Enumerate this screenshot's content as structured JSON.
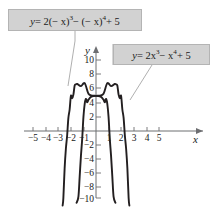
{
  "figure": {
    "name": "polynomial-reflection-graph",
    "background_color": "#ffffff",
    "curve_color": "#231f20",
    "axis_color": "#6d6e71",
    "callout_fill": "#d2d2d2",
    "callout_border": "#b4b4b4",
    "leader_color": "#9a9a9a"
  },
  "callouts": {
    "left": {
      "y": "y",
      "eq": "= 2(− x)",
      "exp1": "3",
      "op2": "− (− x)",
      "exp2": "4",
      "tail": "+ 5",
      "full_text": "y = 2(− x)³ − (− x)⁴ + 5"
    },
    "right": {
      "y": "y",
      "eq": "= 2x",
      "exp1": "3",
      "op2": "− x",
      "exp2": "4",
      "tail": "+ 5",
      "full_text": "y = 2x³ − x⁴ + 5"
    }
  },
  "axes": {
    "x_label": "x",
    "y_label": "y",
    "x_ticks": [
      {
        "value": -5,
        "label": "−5"
      },
      {
        "value": -4,
        "label": "−4"
      },
      {
        "value": -3,
        "label": "−3"
      },
      {
        "value": -2,
        "label": "−2"
      },
      {
        "value": -1,
        "label": "−1"
      },
      {
        "value": 1,
        "label": "1"
      },
      {
        "value": 2,
        "label": "2"
      },
      {
        "value": 3,
        "label": "3"
      },
      {
        "value": 4,
        "label": "4"
      },
      {
        "value": 5,
        "label": "5"
      }
    ],
    "y_ticks": [
      {
        "value": 10,
        "label": "10"
      },
      {
        "value": 8,
        "label": "8"
      },
      {
        "value": 6,
        "label": "6"
      },
      {
        "value": 4,
        "label": "4"
      },
      {
        "value": 2,
        "label": "2"
      },
      {
        "value": -2,
        "label": "−2"
      },
      {
        "value": -4,
        "label": "−4"
      },
      {
        "value": -6,
        "label": "−6"
      },
      {
        "value": -8,
        "label": "−8"
      },
      {
        "value": -10,
        "label": "−10"
      }
    ]
  },
  "chart_data": {
    "type": "line",
    "title": "",
    "xlabel": "x",
    "ylabel": "y",
    "xlim": [
      -5.6,
      5.6
    ],
    "ylim": [
      -10.6,
      11.2
    ],
    "grid": false,
    "legend": "callout-labels",
    "series": [
      {
        "name": "y = 2x³ − x⁴ + 5",
        "equation": "y = 2*x^3 - x^4 + 5",
        "color": "#231f20",
        "points": [
          {
            "x": -1.55,
            "y": -10.21
          },
          {
            "x": -1.4,
            "y": -9.33
          },
          {
            "x": -1.3,
            "y": -6.45
          },
          {
            "x": -1.2,
            "y": -3.53
          },
          {
            "x": -1.1,
            "y": -1.12
          },
          {
            "x": -1.0,
            "y": 2.0
          },
          {
            "x": -0.9,
            "y": 3.87
          },
          {
            "x": -0.8,
            "y": 4.56
          },
          {
            "x": -0.7,
            "y": 4.07
          },
          {
            "x": -0.6,
            "y": 4.44
          },
          {
            "x": -0.5,
            "y": 4.69
          },
          {
            "x": -0.4,
            "y": 4.85
          },
          {
            "x": -0.2,
            "y": 4.98
          },
          {
            "x": 0.0,
            "y": 5.0
          },
          {
            "x": 0.3,
            "y": 5.04
          },
          {
            "x": 0.6,
            "y": 5.3
          },
          {
            "x": 0.9,
            "y": 6.8
          },
          {
            "x": 1.2,
            "y": 6.38
          },
          {
            "x": 1.5,
            "y": 6.69
          },
          {
            "x": 1.6,
            "y": 6.64
          },
          {
            "x": 1.7,
            "y": 6.47
          },
          {
            "x": 1.8,
            "y": 5.17
          },
          {
            "x": 1.9,
            "y": 4.67
          },
          {
            "x": 2.0,
            "y": 5.0
          },
          {
            "x": 2.1,
            "y": 3.06
          },
          {
            "x": 2.2,
            "y": 1.86
          },
          {
            "x": 2.3,
            "y": -0.64
          },
          {
            "x": 2.4,
            "y": -2.52
          },
          {
            "x": 2.5,
            "y": -5.31
          },
          {
            "x": 2.6,
            "y": -9.54
          },
          {
            "x": 2.66,
            "y": -10.6
          }
        ]
      },
      {
        "name": "y = 2(−x)³ − (−x)⁴ + 5",
        "equation": "y = 2*(-x)^3 - (-x)^4 + 5",
        "color": "#231f20",
        "points": [
          {
            "x": 1.55,
            "y": -10.21
          },
          {
            "x": 1.4,
            "y": -9.33
          },
          {
            "x": 1.3,
            "y": -6.45
          },
          {
            "x": 1.2,
            "y": -3.53
          },
          {
            "x": 1.1,
            "y": -1.12
          },
          {
            "x": 1.0,
            "y": 2.0
          },
          {
            "x": 0.9,
            "y": 3.87
          },
          {
            "x": 0.8,
            "y": 4.56
          },
          {
            "x": 0.7,
            "y": 4.07
          },
          {
            "x": 0.6,
            "y": 4.44
          },
          {
            "x": 0.5,
            "y": 4.69
          },
          {
            "x": 0.4,
            "y": 4.85
          },
          {
            "x": 0.2,
            "y": 4.98
          },
          {
            "x": 0.0,
            "y": 5.0
          },
          {
            "x": -0.3,
            "y": 5.04
          },
          {
            "x": -0.6,
            "y": 5.3
          },
          {
            "x": -0.9,
            "y": 6.8
          },
          {
            "x": -1.2,
            "y": 6.38
          },
          {
            "x": -1.5,
            "y": 6.69
          },
          {
            "x": -1.6,
            "y": 6.64
          },
          {
            "x": -1.7,
            "y": 6.47
          },
          {
            "x": -1.8,
            "y": 5.17
          },
          {
            "x": -1.9,
            "y": 4.67
          },
          {
            "x": -2.0,
            "y": 5.0
          },
          {
            "x": -2.1,
            "y": 3.06
          },
          {
            "x": -2.2,
            "y": 1.86
          },
          {
            "x": -2.3,
            "y": -0.64
          },
          {
            "x": -2.4,
            "y": -2.52
          },
          {
            "x": -2.5,
            "y": -5.31
          },
          {
            "x": -2.6,
            "y": -9.54
          },
          {
            "x": -2.66,
            "y": -10.6
          }
        ]
      }
    ]
  }
}
